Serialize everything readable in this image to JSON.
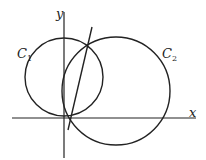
{
  "diagram": {
    "axes": {
      "x_label": "x",
      "y_label": "y"
    },
    "circles": [
      {
        "label": "C",
        "subscript": "1"
      },
      {
        "label": "C",
        "subscript": "2"
      }
    ],
    "stroke_color": "#222222"
  }
}
